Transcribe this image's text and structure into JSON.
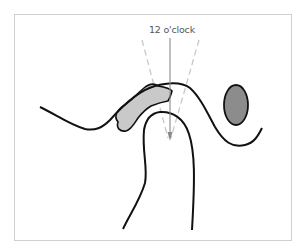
{
  "diagram": {
    "label": "12 o'clock",
    "colors": {
      "outline": "#111111",
      "frame": "#cfcfcf",
      "guide_line": "#8a8a8a",
      "dashed_line": "#c8c8c8",
      "light_fill": "#c9c9c9",
      "dark_fill": "#8c8c8c",
      "label": "#555555"
    },
    "elements": [
      "outer-curve",
      "inner-arch",
      "light-gray-region",
      "dark-gray-oval",
      "vertical-12-oclock-guide-with-arrow",
      "dashed-angle-lines"
    ]
  }
}
